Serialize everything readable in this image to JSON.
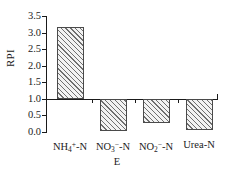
{
  "chart_data": {
    "type": "bar",
    "title": "",
    "xlabel": "E",
    "ylabel": "RPI",
    "categories": [
      "NH4+-N",
      "NO3--N",
      "NO2--N",
      "Urea-N"
    ],
    "category_labels": [
      {
        "base": "NH",
        "sub": "4",
        "sup": "+",
        "tail": "-N"
      },
      {
        "base": "NO",
        "sub": "3",
        "sup": "−",
        "tail": "-N"
      },
      {
        "base": "NO",
        "sub": "2",
        "sup": "−",
        "tail": "-N"
      },
      {
        "base": "Urea",
        "sub": "",
        "sup": "",
        "tail": "-N"
      }
    ],
    "values": [
      3.17,
      0.02,
      0.28,
      0.05
    ],
    "baseline": 1.0,
    "ylim": [
      0.0,
      3.5
    ],
    "yticks": [
      "0.0",
      "0.5",
      "1.0",
      "1.5",
      "2.0",
      "2.5",
      "3.0",
      "3.5"
    ],
    "ytick_values": [
      0.0,
      0.5,
      1.0,
      1.5,
      2.0,
      2.5,
      3.0,
      3.5
    ],
    "grid": false,
    "legend": null,
    "bar_fill": "hatch-diagonal",
    "bar_edge_color": "#4a4a4a",
    "axis_color": "#1a1a1a"
  }
}
